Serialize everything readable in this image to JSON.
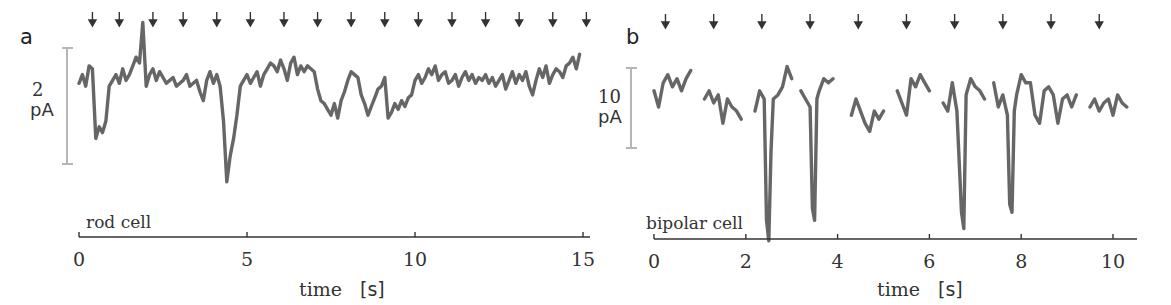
{
  "chart_data": [
    {
      "panel": "a",
      "type": "line",
      "title": "",
      "annotation": "rod cell",
      "xlabel": "time",
      "xunit": "[s]",
      "xlim": [
        0,
        15.3
      ],
      "xticks": [
        0,
        5,
        10,
        15
      ],
      "xtick_labels": [
        "0",
        "5",
        "10",
        "15"
      ],
      "scale_bar": {
        "value": "2",
        "unit": "pA"
      },
      "stimulus_arrows_s": [
        0.4,
        1.2,
        2.2,
        3.1,
        4.1,
        5.1,
        6.1,
        7.1,
        8.1,
        9.1,
        10.1,
        11.1,
        12.1,
        13.1,
        14.1,
        15.1
      ],
      "series": [
        {
          "name": "rod cell current",
          "x": [
            0.0,
            0.1,
            0.2,
            0.3,
            0.4,
            0.5,
            0.6,
            0.7,
            0.8,
            0.9,
            1.0,
            1.1,
            1.2,
            1.3,
            1.4,
            1.5,
            1.6,
            1.7,
            1.8,
            1.9,
            2.0,
            2.1,
            2.2,
            2.3,
            2.4,
            2.5,
            2.6,
            2.7,
            2.8,
            2.9,
            3.0,
            3.1,
            3.2,
            3.3,
            3.4,
            3.5,
            3.6,
            3.7,
            3.8,
            3.9,
            4.0,
            4.1,
            4.2,
            4.3,
            4.4,
            4.5,
            4.6,
            4.7,
            4.8,
            4.9,
            5.0,
            5.1,
            5.2,
            5.3,
            5.4,
            5.5,
            5.6,
            5.7,
            5.8,
            5.9,
            6.0,
            6.1,
            6.2,
            6.3,
            6.4,
            6.5,
            6.6,
            6.7,
            6.8,
            6.9,
            7.0,
            7.1,
            7.2,
            7.3,
            7.4,
            7.5,
            7.6,
            7.7,
            7.8,
            7.9,
            8.0,
            8.1,
            8.2,
            8.3,
            8.4,
            8.5,
            8.6,
            8.7,
            8.8,
            8.9,
            9.0,
            9.1,
            9.2,
            9.3,
            9.4,
            9.5,
            9.6,
            9.7,
            9.8,
            9.9,
            10.0,
            10.1,
            10.2,
            10.3,
            10.4,
            10.5,
            10.6,
            10.7,
            10.8,
            10.9,
            11.0,
            11.1,
            11.2,
            11.3,
            11.4,
            11.5,
            11.6,
            11.7,
            11.8,
            11.9,
            12.0,
            12.1,
            12.2,
            12.3,
            12.4,
            12.5,
            12.6,
            12.7,
            12.8,
            12.9,
            13.0,
            13.1,
            13.2,
            13.3,
            13.4,
            13.5,
            13.6,
            13.7,
            13.8,
            13.9,
            14.0,
            14.1,
            14.2,
            14.3,
            14.4,
            14.5,
            14.6,
            14.7,
            14.8,
            14.9
          ],
          "y": [
            0.3,
            0.6,
            0.2,
            0.9,
            0.8,
            -1.6,
            -1.2,
            -1.4,
            -1.0,
            0.2,
            0.4,
            0.6,
            0.3,
            0.8,
            0.4,
            0.6,
            0.9,
            1.2,
            1.0,
            2.4,
            0.2,
            0.6,
            0.8,
            0.4,
            0.7,
            0.5,
            0.3,
            0.4,
            0.5,
            0.2,
            0.3,
            0.4,
            0.6,
            0.2,
            0.3,
            0.4,
            0.0,
            -0.3,
            0.4,
            0.7,
            0.3,
            0.6,
            0.2,
            -1.0,
            -3.1,
            -2.2,
            -1.6,
            -0.8,
            0.2,
            0.4,
            0.6,
            0.3,
            0.5,
            0.7,
            0.2,
            0.6,
            0.8,
            1.0,
            0.9,
            0.7,
            1.1,
            0.8,
            0.4,
            1.0,
            1.2,
            0.6,
            0.9,
            0.7,
            0.9,
            0.8,
            0.7,
            0.1,
            -0.3,
            -0.4,
            -0.6,
            -0.8,
            -0.4,
            -0.9,
            -0.3,
            0.0,
            0.4,
            0.7,
            0.6,
            0.5,
            -0.1,
            -0.4,
            -0.8,
            -0.5,
            -0.2,
            0.1,
            0.2,
            0.5,
            -0.9,
            -0.7,
            -0.4,
            -0.6,
            -0.3,
            -0.5,
            -0.2,
            -0.1,
            0.4,
            0.6,
            0.3,
            0.5,
            0.8,
            0.6,
            0.9,
            0.4,
            0.6,
            0.7,
            0.3,
            0.4,
            0.6,
            0.2,
            0.5,
            0.7,
            0.4,
            0.6,
            0.3,
            0.5,
            0.4,
            0.6,
            0.3,
            0.5,
            0.2,
            0.4,
            0.6,
            0.1,
            0.4,
            0.7,
            0.3,
            0.6,
            0.4,
            0.7,
            0.2,
            -0.1,
            0.4,
            0.8,
            0.5,
            0.9,
            0.3,
            0.6,
            0.8,
            0.7,
            0.5,
            0.9,
            1.0,
            1.2,
            0.8,
            1.3
          ]
        }
      ]
    },
    {
      "panel": "b",
      "type": "line",
      "title": "",
      "annotation": "bipolar cell",
      "xlabel": "time",
      "xunit": "[s]",
      "xlim": [
        0,
        10.5
      ],
      "xticks": [
        0,
        2,
        4,
        6,
        8,
        10
      ],
      "xtick_labels": [
        "0",
        "2",
        "4",
        "6",
        "8",
        "10"
      ],
      "scale_bar": {
        "value": "10",
        "unit": "pA"
      },
      "stimulus_arrows_s": [
        0.25,
        1.3,
        2.35,
        3.4,
        4.45,
        5.5,
        6.55,
        7.6,
        8.65,
        9.7
      ],
      "series": [
        {
          "name": "bipolar cell current",
          "x": [
            0.0,
            0.1,
            0.2,
            0.3,
            0.4,
            0.5,
            0.6,
            0.7,
            0.8,
            1.1,
            1.2,
            1.3,
            1.4,
            1.5,
            1.6,
            1.7,
            1.8,
            1.9,
            2.2,
            2.3,
            2.4,
            2.45,
            2.5,
            2.55,
            2.6,
            2.7,
            2.8,
            2.9,
            3.0,
            3.2,
            3.3,
            3.4,
            3.45,
            3.5,
            3.55,
            3.6,
            3.7,
            3.8,
            3.9,
            4.3,
            4.4,
            4.5,
            4.6,
            4.7,
            4.8,
            4.9,
            5.0,
            5.3,
            5.4,
            5.5,
            5.6,
            5.7,
            5.8,
            5.9,
            6.0,
            6.3,
            6.4,
            6.5,
            6.6,
            6.7,
            6.75,
            6.8,
            6.9,
            7.0,
            7.1,
            7.2,
            7.4,
            7.5,
            7.6,
            7.7,
            7.75,
            7.8,
            7.85,
            7.9,
            8.0,
            8.1,
            8.2,
            8.3,
            8.4,
            8.5,
            8.6,
            8.7,
            8.8,
            8.9,
            9.0,
            9.1,
            9.2,
            9.5,
            9.6,
            9.7,
            9.8,
            9.9,
            10.0,
            10.1,
            10.2,
            10.3
          ],
          "y": [
            1.5,
            -0.5,
            2.5,
            3.5,
            2.0,
            3.0,
            1.5,
            3.0,
            4.0,
            0.5,
            1.5,
            0.0,
            1.0,
            -2.5,
            0.5,
            -0.5,
            -1.0,
            -2.0,
            -1.0,
            1.5,
            0.5,
            -14.5,
            -17.0,
            -6.0,
            0.5,
            1.0,
            2.0,
            4.5,
            3.0,
            1.5,
            0.5,
            -0.5,
            -13.0,
            -14.5,
            0.5,
            1.5,
            3.0,
            2.5,
            3.0,
            -1.5,
            0.5,
            -1.0,
            -2.5,
            -3.5,
            -1.0,
            -2.0,
            -1.0,
            1.5,
            0.0,
            -1.5,
            3.0,
            2.0,
            3.5,
            2.5,
            1.5,
            0.0,
            -1.0,
            2.5,
            -1.0,
            -13.5,
            -15.5,
            1.0,
            3.0,
            2.0,
            1.5,
            0.5,
            2.5,
            -0.5,
            1.0,
            -1.5,
            -12.5,
            -13.5,
            -1.0,
            1.0,
            3.5,
            2.5,
            2.5,
            -1.5,
            -2.5,
            1.5,
            2.0,
            1.0,
            -2.5,
            0.5,
            1.0,
            -0.5,
            1.0,
            -0.5,
            0.5,
            -1.0,
            0.0,
            0.5,
            -1.5,
            1.0,
            0.0,
            -0.5
          ]
        }
      ]
    }
  ],
  "panels": {
    "a": {
      "letter": "a",
      "cell_label": "rod cell",
      "scale_value": "2",
      "scale_unit": "pA",
      "tick_labels": [
        "0",
        "5",
        "10",
        "15"
      ],
      "xlabel": "time",
      "xunit": "[s]"
    },
    "b": {
      "letter": "b",
      "cell_label": "bipolar cell",
      "scale_value": "10",
      "scale_unit": "pA",
      "tick_labels": [
        "0",
        "2",
        "4",
        "6",
        "8",
        "10"
      ],
      "xlabel": "time",
      "xunit": "[s]"
    }
  },
  "colors": {
    "trace": "#666666",
    "axis": "#333333",
    "scale_bar": "#b5b5b5"
  }
}
